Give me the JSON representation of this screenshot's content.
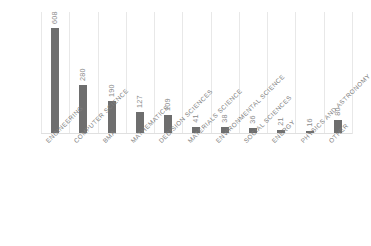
{
  "chart_data": {
    "type": "bar",
    "title": "",
    "subtitle": "",
    "xlabel": "",
    "ylabel": "",
    "ylim": [
      0,
      700
    ],
    "grid": "vertical-only",
    "legend": "none",
    "orientation": "vertical",
    "value_label_rotation": "-90",
    "category_label_rotation": "-45",
    "bar_color": "#6e6e6e",
    "gridline_color": "#e8e8e8",
    "value_label_color": "#8a8a8a",
    "category_label_color": "#808080",
    "background_color": "#ffffff",
    "categories": [
      "ENGINEERING",
      "COMPUTER SCIENCE",
      "BMA",
      "MATHEMATICS",
      "DECISION SCIENCES",
      "MATERIALS SCIENCE",
      "ENVIRONMENTAL SCIENCE",
      "SOCIAL SCIENCES",
      "ENERGY",
      "PHYSICS AND ASTRONOMY",
      "OTHER"
    ],
    "values": [
      608,
      280,
      190,
      127,
      109,
      41,
      38,
      36,
      21,
      16,
      80
    ],
    "value_labels": [
      "608",
      "280",
      "190",
      "127",
      "109",
      "41",
      "38",
      "36",
      "21",
      "16",
      "80"
    ]
  }
}
